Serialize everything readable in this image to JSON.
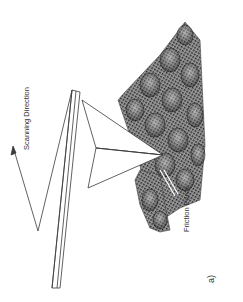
{
  "figure": {
    "panel_label": "a)",
    "labels": {
      "scanning_direction": "Scanning Direction",
      "friction_force": "Friction Force"
    },
    "colors": {
      "background": "#ffffff",
      "line": "#3a3a3a",
      "mesh_dark": "#2a2a2a",
      "mesh_light": "#9a9a9a",
      "text": "#333333"
    }
  }
}
